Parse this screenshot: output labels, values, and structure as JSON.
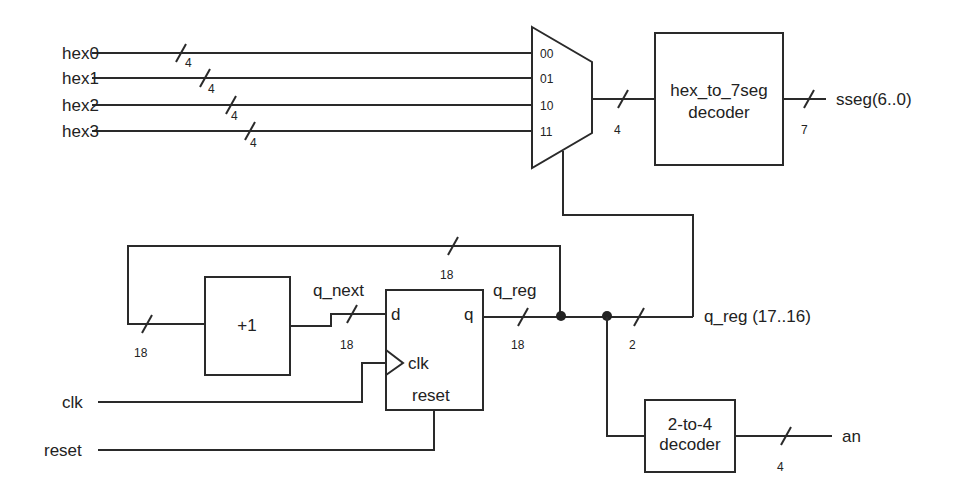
{
  "diagram": {
    "title": "",
    "inputs": [
      {
        "id": "hex0",
        "label": "hex0",
        "width": "4"
      },
      {
        "id": "hex1",
        "label": "hex1",
        "width": "4"
      },
      {
        "id": "hex2",
        "label": "hex2",
        "width": "4"
      },
      {
        "id": "hex3",
        "label": "hex3",
        "width": "4"
      },
      {
        "id": "clk",
        "label": "clk"
      },
      {
        "id": "reset",
        "label": "reset"
      }
    ],
    "mux": {
      "select_labels": [
        "00",
        "01",
        "10",
        "11"
      ],
      "output_width": "4"
    },
    "hex_decoder": {
      "line1": "hex_to_7seg",
      "line2": "decoder",
      "output_label": "sseg(6..0)",
      "output_width": "7"
    },
    "incrementer": {
      "label": "+1",
      "input_width": "18",
      "output_label": "q_next",
      "output_width": "18"
    },
    "register": {
      "d_label": "d",
      "q_label": "q",
      "clk_label": "clk",
      "reset_label": "reset",
      "output_label": "q_reg",
      "output_width": "18",
      "feedback_width": "18"
    },
    "select_bus": {
      "label": "q_reg (17..16)",
      "width": "2"
    },
    "an_decoder": {
      "line1": "2-to-4",
      "line2": "decoder",
      "output_label": "an",
      "output_width": "4"
    }
  }
}
